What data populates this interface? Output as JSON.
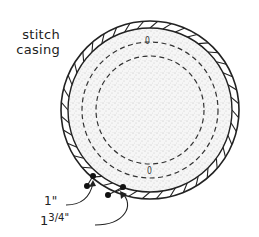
{
  "diagram": {
    "labels": {
      "casing_line1": "stitch",
      "casing_line2": "casing",
      "one_inch": "1\"",
      "one_three_quarter_whole": "1",
      "one_three_quarter_frac": "3/4\""
    },
    "markers": {
      "top_mark": "0",
      "bottom_mark": "0"
    },
    "shapes": {
      "outer_circle": {
        "cx": 150,
        "cy": 110,
        "r": 89
      },
      "casing_inner": {
        "cx": 150,
        "cy": 110,
        "r": 82
      },
      "dashed_outer": {
        "cx": 150,
        "cy": 110,
        "r": 68,
        "style": "dashed"
      },
      "dashed_inner": {
        "cx": 150,
        "cy": 110,
        "r": 54,
        "style": "dashed"
      }
    },
    "measurements": [
      {
        "label": "1\"",
        "from": [
          87,
          186
        ],
        "to": [
          93,
          176
        ]
      },
      {
        "label": "1 3/4\"",
        "from": [
          108,
          195
        ],
        "to": [
          123,
          187
        ]
      }
    ],
    "colors": {
      "stroke": "#222222",
      "fill_stipple": "#f2f2f2",
      "background": "#ffffff"
    }
  }
}
